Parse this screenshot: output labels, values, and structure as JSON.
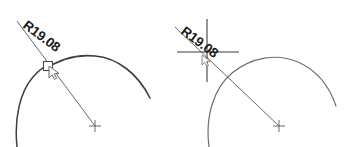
{
  "drawing": {
    "type": "cad-radius-dimension-grip-edit",
    "background_color": "#ffffff",
    "line_color": "#58585c",
    "arc_color": "#3f3f44",
    "text_color": "#1a1a1a",
    "grip_fill": "#ffffff",
    "grip_stroke": "#4a4a50",
    "cursor_color": "#6a6a70"
  },
  "figures": [
    {
      "id": "before",
      "name": "radius-dimension-grip-selected",
      "dimension_label": "R19.08",
      "dimension_value": 19.08,
      "dimension_prefix": "R",
      "label_rotation_deg": 37,
      "grip": {
        "name": "radius-dimension-grip",
        "shape": "square",
        "state": "hover",
        "x": 48,
        "y": 66
      },
      "cursor": {
        "name": "drag-cursor",
        "x": 53,
        "y": 70
      },
      "center_marker": {
        "name": "arc-center-cross",
        "x": 95,
        "y": 126
      },
      "leader": {
        "start_x": 17,
        "start_y": 21,
        "end_x": 95,
        "end_y": 126
      }
    },
    {
      "id": "after",
      "name": "radius-dimension-grip-dragged",
      "dimension_label": "R19.08",
      "dimension_value": 19.08,
      "dimension_prefix": "R",
      "label_rotation_deg": 37,
      "crosshair": {
        "name": "drag-crosshair",
        "center_x": 207,
        "center_y": 52,
        "h_start_x": 177,
        "h_end_x": 239,
        "v_start_y": 19,
        "v_end_y": 82
      },
      "cursor": {
        "name": "drag-cursor",
        "x": 205,
        "y": 57
      },
      "center_marker": {
        "name": "arc-center-cross",
        "x": 279,
        "y": 126
      },
      "leader": {
        "start_x": 175,
        "start_y": 27,
        "end_x": 279,
        "end_y": 126
      }
    }
  ],
  "labels": {
    "left_dimension": "R19.08",
    "right_dimension": "R19.08"
  }
}
